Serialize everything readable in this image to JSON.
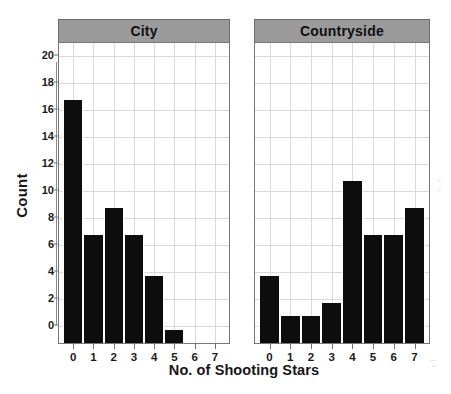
{
  "chart_data": {
    "type": "bar",
    "title": "",
    "xlabel": "No. of Shooting Stars",
    "ylabel": "Count",
    "categories": [
      "0",
      "1",
      "2",
      "3",
      "4",
      "5",
      "6",
      "7"
    ],
    "ylim": [
      0,
      21
    ],
    "yticks": [
      0,
      2,
      4,
      6,
      8,
      10,
      12,
      14,
      16,
      18,
      20
    ],
    "ytick_labels": [
      "0",
      "2",
      "4",
      "6",
      "8",
      "10",
      "12",
      "14",
      "16",
      "18",
      "20"
    ],
    "grid": true,
    "legend": "none",
    "facet_layout": "1x2",
    "panels": [
      {
        "label": "City",
        "values": [
          18,
          8,
          10,
          8,
          5,
          1,
          0,
          0
        ]
      },
      {
        "label": "Countryside",
        "values": [
          5,
          2,
          2,
          3,
          12,
          8,
          8,
          10
        ]
      }
    ],
    "series": [
      {
        "name": "City",
        "values": [
          18,
          8,
          10,
          8,
          5,
          1,
          0,
          0
        ]
      },
      {
        "name": "Countryside",
        "values": [
          5,
          2,
          2,
          3,
          12,
          8,
          8,
          10
        ]
      }
    ],
    "colors": {
      "bar": "#0d0d0d",
      "panel_header_bg": "#9b9b9b",
      "panel_border": "#777777",
      "gridline": "#d9d9d9",
      "plot_bg": "#ffffff",
      "text": "#161616"
    }
  }
}
